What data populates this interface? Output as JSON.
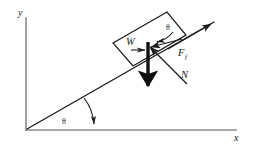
{
  "figure": {
    "kind": "free-body-diagram",
    "colors": {
      "axis": "#808080",
      "line": "#1a1a1a",
      "weight_arrow": "#111111",
      "background": "#ffffff"
    }
  },
  "axes": {
    "y_label": "y",
    "x_label": "x"
  },
  "labels": {
    "weight": "W",
    "normal": "N",
    "friction_base": "F",
    "friction_sub": "f",
    "angle_incline": "θ",
    "angle_block": "θ"
  }
}
